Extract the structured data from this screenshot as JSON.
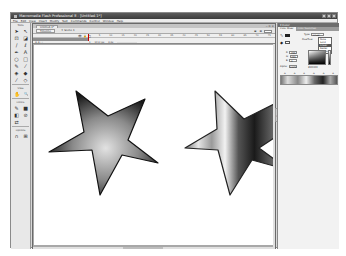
{
  "window": {
    "title": "Macromedia Flash Professional 8 - [Untitled-1*]",
    "controls": [
      "minimize",
      "maximize",
      "close"
    ]
  },
  "menu": [
    "File",
    "Edit",
    "View",
    "Insert",
    "Modify",
    "Text",
    "Commands",
    "Control",
    "Window",
    "Help"
  ],
  "tools": {
    "title": "Tools",
    "items": [
      {
        "icon": "arrow-icon",
        "glyph": "➤"
      },
      {
        "icon": "subselect-icon",
        "glyph": "↖"
      },
      {
        "icon": "free-transform-icon",
        "glyph": "⊡"
      },
      {
        "icon": "gradient-transform-icon",
        "glyph": "◪"
      },
      {
        "icon": "line-icon",
        "glyph": "∕"
      },
      {
        "icon": "lasso-icon",
        "glyph": "ℓ"
      },
      {
        "icon": "pen-icon",
        "glyph": "✒"
      },
      {
        "icon": "text-icon",
        "glyph": "A"
      },
      {
        "icon": "oval-icon",
        "glyph": "○"
      },
      {
        "icon": "rectangle-icon",
        "glyph": "□"
      },
      {
        "icon": "pencil-icon",
        "glyph": "✎"
      },
      {
        "icon": "brush-icon",
        "glyph": "⁄"
      },
      {
        "icon": "ink-bottle-icon",
        "glyph": "◈"
      },
      {
        "icon": "paint-bucket-icon",
        "glyph": "◆"
      },
      {
        "icon": "eyedropper-icon",
        "glyph": "⁄"
      },
      {
        "icon": "eraser-icon",
        "glyph": "◇"
      }
    ],
    "view_label": "View",
    "view_items": [
      {
        "icon": "hand-icon",
        "glyph": "✋"
      },
      {
        "icon": "zoom-icon",
        "glyph": "🔍"
      }
    ],
    "colors_label": "Colors",
    "colors_items": [
      {
        "icon": "stroke-color-icon",
        "glyph": "✎"
      },
      {
        "icon": "fill-color-icon",
        "glyph": "■"
      },
      {
        "icon": "black-white-icon",
        "glyph": "◧"
      },
      {
        "icon": "no-color-icon",
        "glyph": "⊘"
      },
      {
        "icon": "swap-colors-icon",
        "glyph": "⇄"
      }
    ],
    "options_label": "Options",
    "options_items": [
      {
        "icon": "snap-icon",
        "glyph": "∩"
      },
      {
        "icon": "lock-fill-icon",
        "glyph": "⊞"
      }
    ]
  },
  "document": {
    "tab": "Untitled-1*",
    "timeline_button": "Timeline",
    "scene": "Scene 1",
    "edit_icons": "⊕ ⊗",
    "zoom_value": "",
    "frame_numbers": [
      "1",
      "5",
      "10",
      "15",
      "20",
      "25",
      "30",
      "35",
      "40",
      "45",
      "50",
      "55",
      "60",
      "65",
      "70",
      "75"
    ],
    "layer_header_icons": "👁 🔒 □",
    "layer_footer_icons": "⊕ ⊕ ▢",
    "status": {
      "frame": "1",
      "fps": "12.0 fps",
      "time": "0.0s"
    }
  },
  "stage": {
    "background": "#ffffff",
    "shapes": [
      {
        "name": "star-radial",
        "fill": "radial",
        "colors": [
          "#e2e2e2",
          "#8a8a8a",
          "#1a1a1a"
        ],
        "stroke": "#111111"
      },
      {
        "name": "star-linear",
        "fill": "linear",
        "colors": [
          "#777777",
          "#e6e6e6",
          "#9a9a9a",
          "#f2f2f2",
          "#555555",
          "#1a1a1a",
          "#6a6a6a"
        ],
        "stroke": "#222222"
      }
    ]
  },
  "color_panel": {
    "title": "Color",
    "tabs": [
      "Color Mixer",
      "Color Swatches"
    ],
    "type_label": "Type:",
    "type_value": "Linear",
    "overflow_label": "Overflow:",
    "type_options": [
      "None",
      "Solid",
      "Linear",
      "Radial",
      "Bitmap"
    ],
    "selected_option": "Linear",
    "r_label": "R:",
    "r_value": "255",
    "g_label": "G:",
    "g_value": "255",
    "b_label": "B:",
    "b_value": "0",
    "alpha_label": "Alpha:",
    "alpha_value": "100%",
    "hex_value": "#FFFFFF"
  }
}
